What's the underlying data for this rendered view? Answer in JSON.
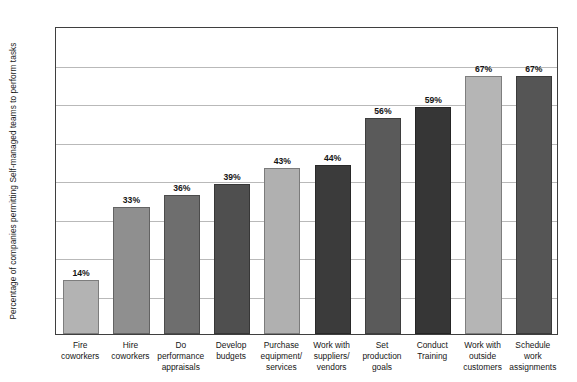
{
  "chart_data": {
    "type": "bar",
    "title": "",
    "xlabel": "",
    "ylabel": "Percentage of companies permitting Self-managed teams to perform tasks",
    "ylim": [
      0,
      80
    ],
    "grid": true,
    "gridline_values": [
      10,
      20,
      30,
      40,
      50,
      60,
      70
    ],
    "legend": null,
    "categories": [
      "Fire coworkers",
      "Hire coworkers",
      "Do performance appraisals",
      "Develop budgets",
      "Purchase equipment/ services",
      "Work with suppliers/ vendors",
      "Set production goals",
      "Conduct Training",
      "Work with outside customers",
      "Schedule work assignments"
    ],
    "category_lines": [
      [
        "Fire",
        "coworkers"
      ],
      [
        "Hire",
        "coworkers"
      ],
      [
        "Do",
        "performance",
        "appraisals"
      ],
      [
        "Develop",
        "budgets"
      ],
      [
        "Purchase",
        "equipment/",
        "services"
      ],
      [
        "Work with",
        "suppliers/",
        "vendors"
      ],
      [
        "Set",
        "production",
        "goals"
      ],
      [
        "Conduct",
        "Training"
      ],
      [
        "Work with",
        "outside",
        "customers"
      ],
      [
        "Schedule",
        "work",
        "assignments"
      ]
    ],
    "values": [
      14,
      33,
      36,
      39,
      43,
      44,
      56,
      59,
      67,
      67
    ],
    "value_labels": [
      "14%",
      "33%",
      "36%",
      "39%",
      "43%",
      "44%",
      "56%",
      "59%",
      "67%",
      "67%"
    ],
    "bar_colors": [
      "#b3b3b3",
      "#8f8f8f",
      "#6e6e6e",
      "#4f4f4f",
      "#b0b0b0",
      "#3b3b3b",
      "#5a5a5a",
      "#363636",
      "#b5b5b5",
      "#555555"
    ]
  },
  "frame": {
    "border_color": "#3f3f3f",
    "grid_color": "#b9b9b9",
    "background": "#ffffff"
  }
}
